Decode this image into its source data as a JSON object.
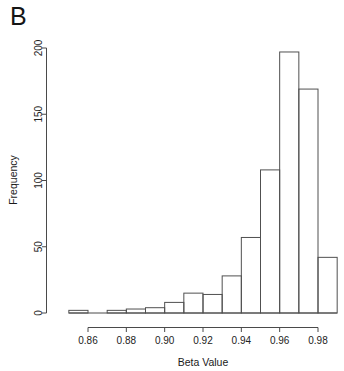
{
  "panel": {
    "label": "B"
  },
  "chart_data": {
    "type": "bar",
    "subtype": "histogram",
    "title": "",
    "xlabel": "Beta Value",
    "ylabel": "Frequency",
    "xlim": [
      0.85,
      0.99
    ],
    "ylim": [
      0,
      200
    ],
    "grid": false,
    "legend": null,
    "bin_width": 0.01,
    "xticks": [
      0.86,
      0.88,
      0.9,
      0.92,
      0.94,
      0.96,
      0.98
    ],
    "xticklabels": [
      "0.86",
      "0.88",
      "0.90",
      "0.92",
      "0.94",
      "0.96",
      "0.98"
    ],
    "yticks": [
      0,
      50,
      100,
      150,
      200
    ],
    "yticklabels": [
      "0",
      "50",
      "100",
      "150",
      "200"
    ],
    "bin_edges": [
      0.85,
      0.86,
      0.87,
      0.88,
      0.89,
      0.9,
      0.91,
      0.92,
      0.93,
      0.94,
      0.95,
      0.96,
      0.97,
      0.98,
      0.99
    ],
    "categories": [
      "0.85-0.86",
      "0.86-0.87",
      "0.87-0.88",
      "0.88-0.89",
      "0.89-0.90",
      "0.90-0.91",
      "0.91-0.92",
      "0.92-0.93",
      "0.93-0.94",
      "0.94-0.95",
      "0.95-0.96",
      "0.96-0.97",
      "0.97-0.98",
      "0.98-0.99"
    ],
    "values": [
      2,
      0,
      2,
      3,
      4,
      8,
      15,
      14,
      28,
      57,
      108,
      197,
      169,
      42
    ]
  }
}
